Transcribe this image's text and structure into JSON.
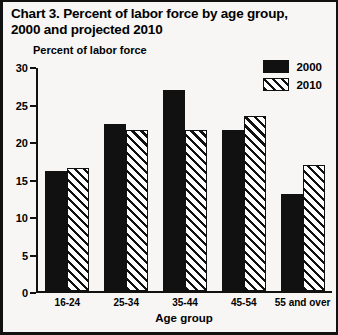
{
  "title": {
    "line1": "Chart 3.  Percent of labor force by age group,",
    "line2": "2000 and projected 2010"
  },
  "axis_unit_label": "Percent of labor force",
  "legend": {
    "items": [
      {
        "label": "2000",
        "pattern": "solid-black"
      },
      {
        "label": "2010",
        "pattern": "diagonal-hatch"
      }
    ]
  },
  "yticks": [
    "0",
    "5",
    "10",
    "15",
    "20",
    "25",
    "30"
  ],
  "chart_data": {
    "type": "bar",
    "title": "Chart 3.  Percent of labor force by age group, 2000 and projected 2010",
    "xlabel": "Age group",
    "ylabel": "Percent of labor force",
    "ylim": [
      0,
      30
    ],
    "ytick_step": 5,
    "grid": false,
    "legend_position": "top-right",
    "categories": [
      "16-24",
      "25-34",
      "35-44",
      "45-54",
      "55 and over"
    ],
    "series": [
      {
        "name": "2000",
        "pattern": "solid-black",
        "color": "#111111",
        "values": [
          16.1,
          22.5,
          27.0,
          21.7,
          13.0
        ]
      },
      {
        "name": "2010",
        "pattern": "diagonal-hatch",
        "color": "#111111",
        "values": [
          16.5,
          21.7,
          21.7,
          23.5,
          17.0
        ]
      }
    ]
  },
  "colors": {
    "ink": "#111111",
    "background": "#f7f6f4"
  }
}
